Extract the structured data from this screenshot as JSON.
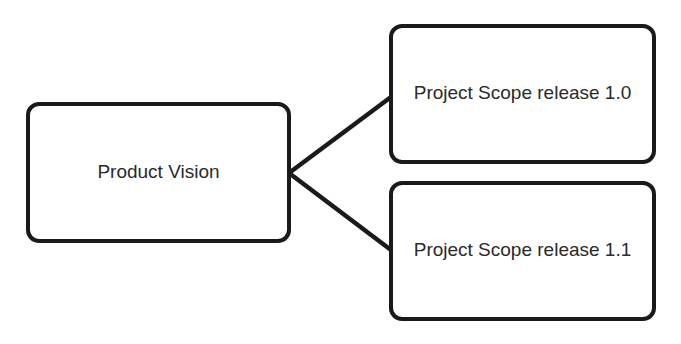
{
  "diagram": {
    "type": "tree",
    "nodes": [
      {
        "id": "vision",
        "label": "Product Vision"
      },
      {
        "id": "r10",
        "label": "Project Scope release 1.0"
      },
      {
        "id": "r11",
        "label": "Project Scope release 1.1"
      }
    ],
    "edges": [
      {
        "from": "vision",
        "to": "r10"
      },
      {
        "from": "vision",
        "to": "r11"
      }
    ],
    "colors": {
      "stroke": "#1a1a1a",
      "fill": "#ffffff",
      "text": "#2a2a2a"
    }
  }
}
